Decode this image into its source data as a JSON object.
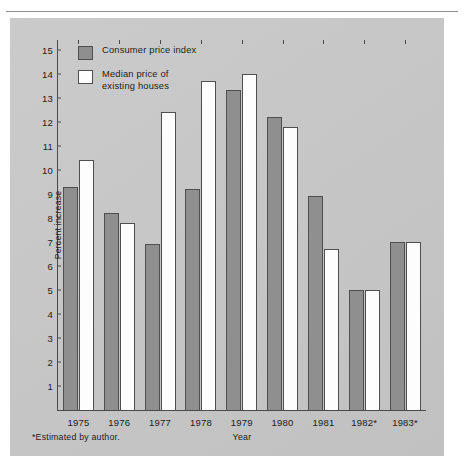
{
  "figure": {
    "footnote": "*Estimated by author."
  },
  "legend": {
    "position": "top-left-inside",
    "items": [
      {
        "label": "Consumer price index",
        "color": "#8f8f8f",
        "swatch": "gray-filled-square"
      },
      {
        "label": "Median price of\nexisting houses",
        "color": "#fdfdfd",
        "swatch": "white-filled-square"
      }
    ]
  },
  "chart_data": {
    "type": "bar",
    "title": "",
    "subtitle": "",
    "xlabel": "Year",
    "ylabel": "Percent increase",
    "categories": [
      "1975",
      "1976",
      "1977",
      "1978",
      "1979",
      "1980",
      "1981",
      "1982*",
      "1983*"
    ],
    "series": [
      {
        "name": "Consumer price index",
        "color": "#8f8f8f",
        "values": [
          9.3,
          8.2,
          6.9,
          9.2,
          13.3,
          12.2,
          8.9,
          5.0,
          7.0
        ]
      },
      {
        "name": "Median price of existing houses",
        "color": "#fdfdfd",
        "values": [
          10.4,
          7.8,
          12.4,
          13.7,
          14.0,
          11.8,
          6.7,
          5.0,
          7.0
        ]
      }
    ],
    "ylim": [
      0,
      15.4
    ],
    "yticks": [
      1,
      2,
      3,
      4,
      5,
      6,
      7,
      8,
      9,
      10,
      11,
      12,
      13,
      14,
      15
    ],
    "ytick_labels": [
      "1",
      "2",
      "3",
      "4",
      "5",
      "6",
      "7",
      "8",
      "9",
      "10",
      "11",
      "12",
      "13",
      "14",
      "15"
    ],
    "grid": false,
    "annotations": [
      "*Estimated by author."
    ]
  },
  "colors": {
    "panel_background": "#c8c8c8",
    "axis": "#4a4a4a",
    "bar_outline": "#4f4f4f",
    "text": "#1c1c1c"
  }
}
